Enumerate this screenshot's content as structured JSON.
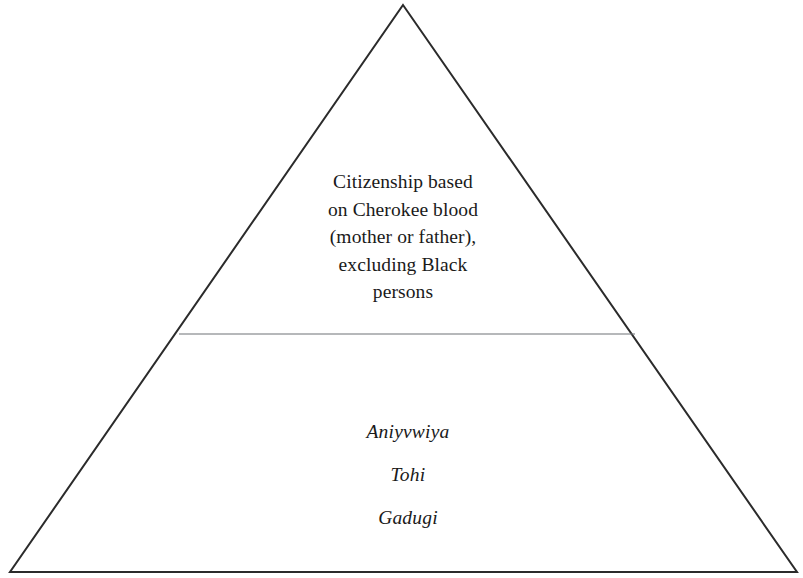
{
  "diagram": {
    "type": "pyramid",
    "shape_name": "triangle-pyramid",
    "background_color": "#ffffff",
    "outline_color": "#2b2b2b",
    "divider_color": "#6f7276",
    "text_color": "#1a1a1a",
    "geometry": {
      "apex_x": 403,
      "apex_y": 5,
      "bottom_left_x": 10,
      "bottom_left_y": 572,
      "bottom_right_x": 797,
      "bottom_right_y": 572,
      "divider_y": 334,
      "divider_left_x": 179,
      "divider_right_x": 635,
      "outline_width": 2,
      "divider_width": 1.1
    },
    "sections": [
      {
        "id": "upper",
        "name": "upper-tier",
        "style": "roman",
        "lines": [
          "Citizenship based",
          "on Cherokee blood",
          "(mother or father),",
          "excluding Black",
          "persons"
        ]
      },
      {
        "id": "lower",
        "name": "lower-tier",
        "style": "italic",
        "lines": [
          "Aniyvwiya",
          "Tohi",
          "Gadugi"
        ]
      }
    ]
  }
}
